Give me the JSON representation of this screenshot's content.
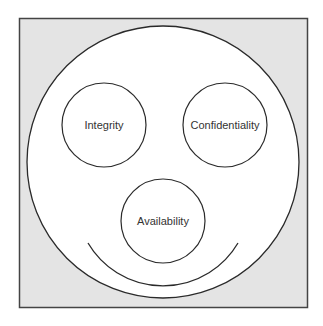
{
  "diagram": {
    "type": "cia-triad-smiley",
    "colors": {
      "frame_fill": "#e4e4e4",
      "frame_border": "#444444",
      "circle_fill": "#ffffff",
      "stroke": "#2a2a2a",
      "text": "#333333"
    },
    "nodes": [
      {
        "id": "integrity",
        "label": "Integrity"
      },
      {
        "id": "confidentiality",
        "label": "Confidentiality"
      },
      {
        "id": "availability",
        "label": "Availability"
      }
    ]
  }
}
